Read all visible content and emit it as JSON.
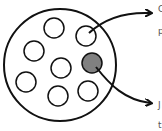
{
  "diagram": {
    "container": {
      "cx": 60,
      "cy": 65,
      "r": 56,
      "stroke": "#111111"
    },
    "cells": [
      {
        "cx": 54,
        "cy": 28,
        "r": 10,
        "fill": "#ffffff"
      },
      {
        "cx": 86,
        "cy": 36,
        "r": 10,
        "fill": "#ffffff"
      },
      {
        "cx": 34,
        "cy": 51,
        "r": 10,
        "fill": "#ffffff"
      },
      {
        "cx": 61,
        "cy": 68,
        "r": 10,
        "fill": "#ffffff"
      },
      {
        "cx": 92,
        "cy": 63,
        "r": 10,
        "fill": "#808080"
      },
      {
        "cx": 26,
        "cy": 82,
        "r": 10,
        "fill": "#ffffff"
      },
      {
        "cx": 58,
        "cy": 96,
        "r": 10,
        "fill": "#ffffff"
      },
      {
        "cx": 88,
        "cy": 91,
        "r": 10,
        "fill": "#ffffff"
      }
    ],
    "labels": [
      {
        "text": "C",
        "x": 158,
        "y": 8
      },
      {
        "text": "p",
        "x": 158,
        "y": 30
      },
      {
        "text": "J",
        "x": 158,
        "y": 104
      },
      {
        "text": "t",
        "x": 158,
        "y": 124
      }
    ]
  }
}
